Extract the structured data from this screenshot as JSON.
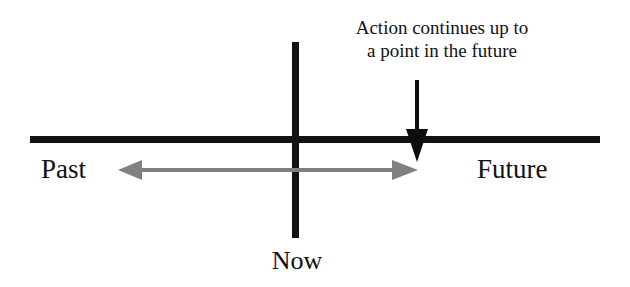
{
  "diagram": {
    "title_caption": {
      "line1": "Action continues up to",
      "line2": "a point in the future"
    },
    "axis_labels": {
      "past": "Past",
      "future": "Future",
      "now": "Now"
    },
    "colors": {
      "axis": "#121212",
      "text": "#111111",
      "span_arrow": "#808080",
      "pointer_arrow": "#0d0d0d",
      "background": "#ffffff"
    },
    "geometry": {
      "horizontal_axis": {
        "x1": 30,
        "x2": 600,
        "y": 139,
        "thickness": 7
      },
      "vertical_axis": {
        "x": 296,
        "y1": 42,
        "y2": 238,
        "thickness": 7
      },
      "span_arrow": {
        "x1": 118,
        "x2": 418,
        "y": 170,
        "double_headed": true
      },
      "pointer_arrow": {
        "x": 417,
        "y1": 80,
        "y2": 162,
        "direction": "down"
      }
    }
  }
}
